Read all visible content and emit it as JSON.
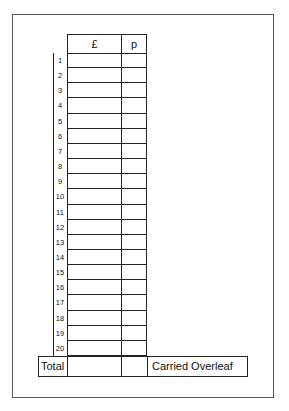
{
  "form": {
    "header": {
      "pounds": "£",
      "pence": "p"
    },
    "rows": [
      "1",
      "2",
      "3",
      "4",
      "5",
      "6",
      "7",
      "8",
      "9",
      "10",
      "11",
      "12",
      "13",
      "14",
      "15",
      "16",
      "17",
      "18",
      "19",
      "20"
    ],
    "total_label": "Total",
    "carried_label": "Carried Overleaf"
  }
}
